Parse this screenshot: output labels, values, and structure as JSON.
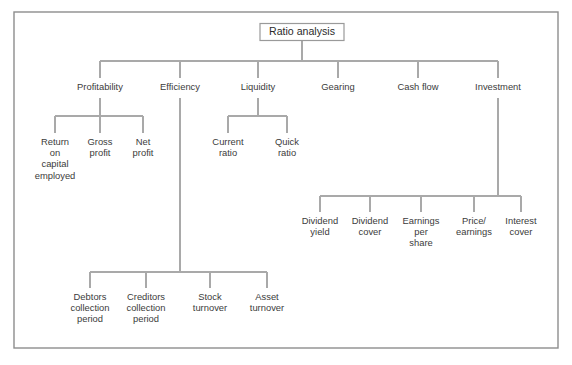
{
  "figure": {
    "title": "Ratio analysis",
    "frame": {
      "x": 14,
      "y": 12,
      "width": 544,
      "height": 336
    },
    "line_color": "#a9a9a9",
    "frame_color": "#8d8d8d",
    "text_color": "#3b3b3b",
    "background": "#ffffff"
  },
  "chart_data": {
    "type": "diagram",
    "title": "Ratio analysis",
    "root": {
      "label": "Ratio analysis",
      "x": 302,
      "y": 32,
      "boxed": true
    },
    "levels": [
      {
        "name": "categories",
        "y": 88,
        "bus_y": 61,
        "items": [
          {
            "label": "Profitability",
            "x": 100
          },
          {
            "label": "Efficiency",
            "x": 180
          },
          {
            "label": "Liquidity",
            "x": 258
          },
          {
            "label": "Gearing",
            "x": 338
          },
          {
            "label": "Cash flow",
            "x": 418
          },
          {
            "label": "Investment",
            "x": 498
          }
        ]
      }
    ],
    "groups": [
      {
        "parent": "Profitability",
        "parent_x": 100,
        "bus_y": 116,
        "label_y": 143,
        "children": [
          {
            "label": "Return\non\ncapital\nemployed",
            "x": 55
          },
          {
            "label": "Gross\nprofit",
            "x": 100
          },
          {
            "label": "Net\nprofit",
            "x": 143
          }
        ]
      },
      {
        "parent": "Liquidity",
        "parent_x": 258,
        "bus_y": 116,
        "label_y": 143,
        "children": [
          {
            "label": "Current\nratio",
            "x": 228
          },
          {
            "label": "Quick\nratio",
            "x": 287
          }
        ]
      },
      {
        "parent": "Investment",
        "parent_x": 498,
        "bus_y": 196,
        "label_y": 222,
        "children": [
          {
            "label": "Dividend\nyield",
            "x": 320
          },
          {
            "label": "Dividend\ncover",
            "x": 370
          },
          {
            "label": "Earnings\nper\nshare",
            "x": 421
          },
          {
            "label": "Price/\nearnings",
            "x": 474
          },
          {
            "label": "Interest\ncover",
            "x": 521
          }
        ]
      },
      {
        "parent": "Efficiency",
        "parent_x": 180,
        "bus_y": 272,
        "label_y": 298,
        "children": [
          {
            "label": "Debtors\ncollection\nperiod",
            "x": 90
          },
          {
            "label": "Creditors\ncollection\nperiod",
            "x": 146
          },
          {
            "label": "Stock\nturnover",
            "x": 210
          },
          {
            "label": "Asset\nturnover",
            "x": 267
          }
        ]
      }
    ],
    "all_labels": [
      "Ratio analysis",
      "Profitability",
      "Efficiency",
      "Liquidity",
      "Gearing",
      "Cash flow",
      "Investment",
      "Return on capital employed",
      "Gross profit",
      "Net profit",
      "Current ratio",
      "Quick ratio",
      "Dividend yield",
      "Dividend cover",
      "Earnings per share",
      "Price/earnings",
      "Interest cover",
      "Debtors collection period",
      "Creditors collection period",
      "Stock turnover",
      "Asset turnover"
    ]
  }
}
